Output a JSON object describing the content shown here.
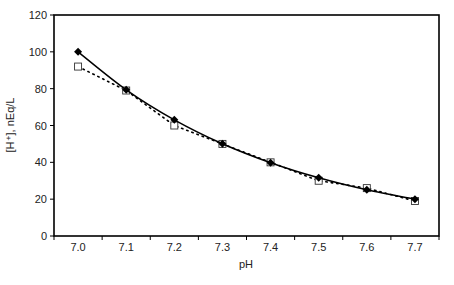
{
  "chart_data": {
    "type": "line",
    "title": "",
    "xlabel": "pH",
    "ylabel": "[H⁺], nEq/L",
    "categories": [
      "7.0",
      "7.1",
      "7.2",
      "7.3",
      "7.4",
      "7.5",
      "7.6",
      "7.7"
    ],
    "ylim": [
      0,
      120
    ],
    "yticks": [
      0,
      20,
      40,
      60,
      80,
      100,
      120
    ],
    "grid": false,
    "legend": "none",
    "series": [
      {
        "name": "Calculated",
        "style": "solid",
        "marker": "filled-diamond",
        "color": "#000000",
        "values": [
          100,
          79.4,
          63.1,
          50.1,
          39.8,
          31.6,
          25.1,
          20.0
        ]
      },
      {
        "name": "Approximation",
        "style": "dotted",
        "marker": "open-square",
        "color": "#000000",
        "values": [
          92,
          79,
          60,
          50,
          40,
          30,
          26,
          19
        ]
      }
    ]
  }
}
